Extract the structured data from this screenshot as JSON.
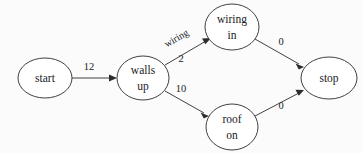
{
  "diagram": {
    "type": "directed-graph",
    "title": "",
    "background_color": "#fbfbfc",
    "stroke_color": "#2b2b30",
    "nodes": [
      {
        "id": "start",
        "label_line1": "start",
        "label_line2": "",
        "cx": 45,
        "cy": 78,
        "rx": 27,
        "ry": 20
      },
      {
        "id": "walls_up",
        "label_line1": "walls",
        "label_line2": "up",
        "cx": 143,
        "cy": 78,
        "rx": 26,
        "ry": 22
      },
      {
        "id": "wiring_in",
        "label_line1": "wiring",
        "label_line2": "in",
        "cx": 232,
        "cy": 27,
        "rx": 27,
        "ry": 23
      },
      {
        "id": "roof_on",
        "label_line1": "roof",
        "label_line2": "on",
        "cx": 232,
        "cy": 127,
        "rx": 26,
        "ry": 23
      },
      {
        "id": "stop",
        "label_line1": "stop",
        "label_line2": "",
        "cx": 329,
        "cy": 78,
        "rx": 28,
        "ry": 21
      }
    ],
    "edges": [
      {
        "id": "start-to-walls",
        "from": "start",
        "to": "walls_up",
        "label": "12",
        "label_x": 89,
        "label_y": 70
      },
      {
        "id": "walls-to-wiring",
        "from": "walls_up",
        "to": "wiring_in",
        "label": "2",
        "label_x": 181,
        "label_y": 62,
        "name_label": "wiring",
        "name_label_x": 178,
        "name_label_y": 41,
        "name_label_rotation": -30
      },
      {
        "id": "walls-to-roof",
        "from": "walls_up",
        "to": "roof_on",
        "label": "10",
        "label_x": 181,
        "label_y": 92
      },
      {
        "id": "wiring-to-stop",
        "from": "wiring_in",
        "to": "stop",
        "label": "0",
        "label_x": 281,
        "label_y": 45
      },
      {
        "id": "roof-to-stop",
        "from": "roof_on",
        "to": "stop",
        "label": "0",
        "label_x": 281,
        "label_y": 109
      }
    ]
  }
}
